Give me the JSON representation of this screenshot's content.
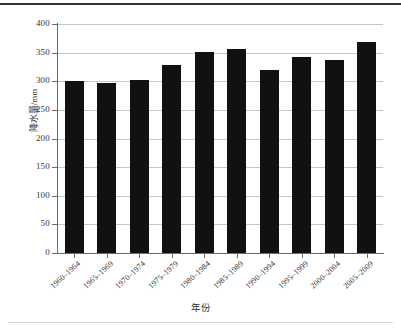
{
  "chart_data": {
    "type": "bar",
    "title": "",
    "xlabel": "年份",
    "ylabel": "降水量/mm",
    "categories": [
      "1960–1964",
      "1965–1969",
      "1970–1974",
      "1975–1979",
      "1980–1984",
      "1985–1989",
      "1990–1994",
      "1995–1999",
      "2000–2004",
      "2005–2009"
    ],
    "values": [
      301,
      297,
      303,
      328,
      351,
      357,
      320,
      343,
      338,
      368
    ],
    "ylim": [
      0,
      400
    ],
    "yticks": [
      "0",
      "50",
      "100",
      "150",
      "200",
      "250",
      "300",
      "350",
      "400"
    ],
    "ytick_values": [
      0,
      50,
      100,
      150,
      200,
      250,
      300,
      350,
      400
    ],
    "grid": "horizontal",
    "legend": "none",
    "bar_color": "#111111",
    "grid_color": "#c9c7c3",
    "axis_color": "#6d6b67"
  }
}
